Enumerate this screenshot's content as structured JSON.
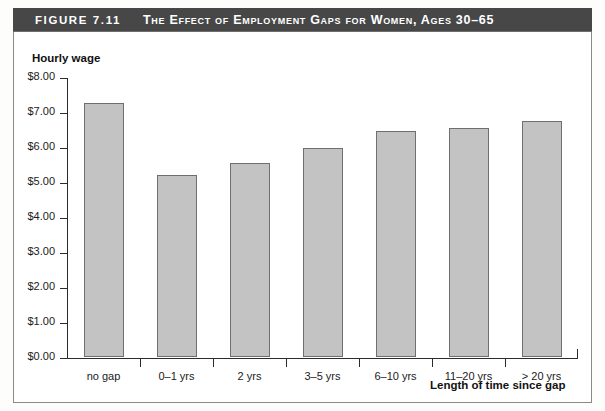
{
  "figure": {
    "number": "FIGURE 7.11",
    "title": "The Effect of Employment Gaps for Women, Ages 30–65"
  },
  "chart_data": {
    "type": "bar",
    "title": "The Effect of Employment Gaps for Women, Ages 30–65",
    "categories": [
      "no gap",
      "0–1 yrs",
      "2 yrs",
      "3–5 yrs",
      "6–10 yrs",
      "11–20 yrs",
      "> 20 yrs"
    ],
    "values": [
      7.25,
      5.2,
      5.55,
      5.98,
      6.45,
      6.55,
      6.75
    ],
    "xlabel": "Length of time since gap",
    "ylabel": "Hourly wage",
    "ylim": [
      0,
      8
    ],
    "ytick_values": [
      0,
      1,
      2,
      3,
      4,
      5,
      6,
      7,
      8
    ],
    "ytick_labels": [
      "$0.00",
      "$1.00",
      "$2.00",
      "$3.00",
      "$4.00",
      "$5.00",
      "$6.00",
      "$7.00",
      "$8.00"
    ],
    "grid": false,
    "legend": null,
    "bar_color": "#c3c3c3",
    "bar_edge_color": "#6f6f6f"
  },
  "colors": {
    "title_bar_background": "#474747",
    "title_text": "#ffffff",
    "axis": "#2b2b2b",
    "page_background": "#ffffff"
  }
}
